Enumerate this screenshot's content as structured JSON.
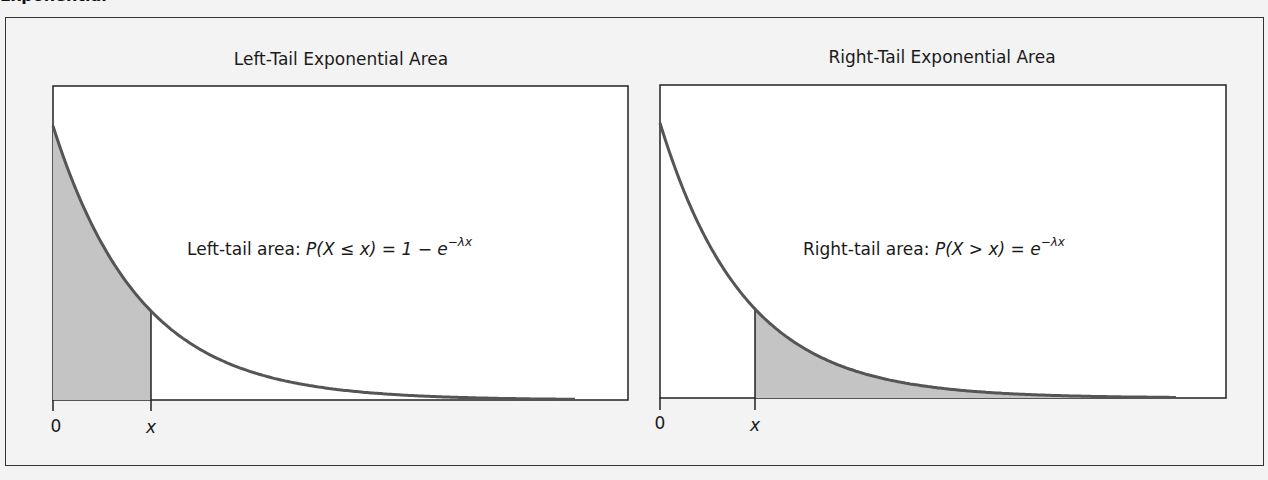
{
  "heading_fragment": "Exponential",
  "panels": [
    {
      "id": "left",
      "title": "Left-Tail Exponential Area",
      "formula": {
        "prefix": "Left-tail area: ",
        "expr_open": "P(X ",
        "relation": "≤",
        "expr_close": " x) = 1 − e",
        "exponent": "−λx"
      },
      "axis_labels": {
        "origin": "0",
        "point": "x"
      },
      "shaded_region": "left"
    },
    {
      "id": "right",
      "title": "Right-Tail Exponential Area",
      "formula": {
        "prefix": "Right-tail area: ",
        "expr_open": "P(X ",
        "relation": ">",
        "expr_close": " x) = e",
        "exponent": "−λx"
      },
      "axis_labels": {
        "origin": "0",
        "point": "x"
      },
      "shaded_region": "right"
    }
  ],
  "colors": {
    "background": "#f3f3f3",
    "plot_background": "#ffffff",
    "curve": "#555555",
    "shade": "#c4c4c4",
    "axis": "#222222"
  },
  "chart_data": [
    {
      "type": "area",
      "title": "Left-Tail Exponential Area",
      "function": "f(x) = λe^(−λx)",
      "shaded": "0 to x",
      "annotation": "Left-tail area: P(X ≤ x) = 1 − e^(−λx)",
      "x_tick_labels": [
        "0",
        "x"
      ],
      "grid": false
    },
    {
      "type": "area",
      "title": "Right-Tail Exponential Area",
      "function": "f(x) = λe^(−λx)",
      "shaded": "x to ∞",
      "annotation": "Right-tail area: P(X > x) = e^(−λx)",
      "x_tick_labels": [
        "0",
        "x"
      ],
      "grid": false
    }
  ]
}
